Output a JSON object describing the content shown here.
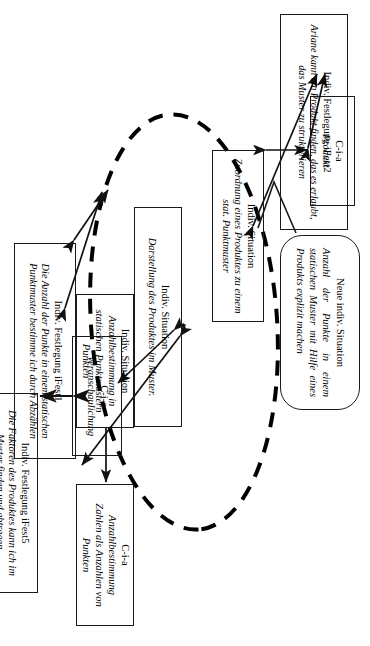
{
  "diagram": {
    "kind": "concept-network",
    "language": "de",
    "orientation": "rotated-90-clockwise",
    "nodes": [
      {
        "id": "ifest2",
        "shape": "rectangle",
        "title": "Indiv. Festlegung iFest2",
        "body": "Ariane kann ein Produkt finden, das es erlaubt, das Muster zu strukturieren"
      },
      {
        "id": "cia-produkt",
        "shape": "rectangle",
        "title": "C-i-a",
        "body": "Produkt"
      },
      {
        "id": "neue-situation",
        "shape": "speech-bubble",
        "title": "Neue indiv. Situation",
        "body": "Anzahl der Punkte in einem statischen Muster mit Hilfe eines Produkts explizit machen"
      },
      {
        "id": "situation-zuordnung",
        "shape": "rectangle",
        "title": "Indiv. Situation",
        "body": "Zuordnung eines Produktes zu einem stat. Punktmuster"
      },
      {
        "id": "situation-darstellung",
        "shape": "rectangle",
        "title": "Indiv. Situation",
        "body": "Darstellung des Produktes im Muster."
      },
      {
        "id": "cia-veranschaulichung",
        "shape": "rectangle",
        "title": "C-i-a",
        "body": "Veranschaulichung"
      },
      {
        "id": "situation-anzahlbestimmung",
        "shape": "rectangle",
        "title": "Indiv. Situation",
        "body": "Anzahlbestimmung in statischen Punktmustern Punkten"
      },
      {
        "id": "ifest1",
        "shape": "rectangle",
        "title": "Indiv. Festlegung iFest1",
        "body": "Die Anzahl der Punkte in einem statischen Punktmuster bestimme ich durch Abzählen"
      },
      {
        "id": "cia-anzahlbestimmung",
        "shape": "rectangle",
        "title": "C-i-a",
        "body": "Anzahlbestimmung",
        "body2": "Zahlen als Anzahlen von Punkten"
      },
      {
        "id": "ifest5",
        "shape": "rectangle",
        "title": "Indiv. Festlegung iFest5",
        "body": "Die Faktoren des Produktes kann ich im Muster finden und abtragen."
      }
    ],
    "overlay": {
      "ellipse_style": "dashed",
      "ellipse_label": ""
    },
    "colors": {
      "stroke": "#1a1a1a",
      "background": "#ffffff",
      "dashed": "#000000"
    }
  }
}
